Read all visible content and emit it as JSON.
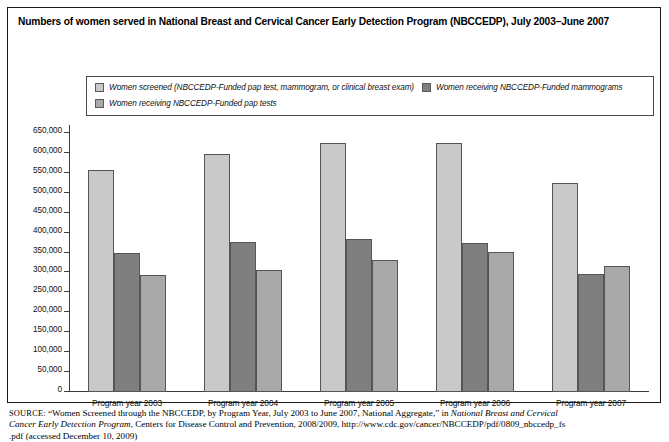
{
  "figure": {
    "title": "Numbers of women served in National Breast and Cervical Cancer Early Detection Program (NBCCEDP), July 2003–June 2007"
  },
  "legend": {
    "position": "top-inside-box",
    "entries": [
      {
        "label": "Women screened (NBCCEDP-Funded pap test, mammogram, or clinical breast exam)",
        "color": "#c9c9c9"
      },
      {
        "label": "Women receiving NBCCEDP-Funded mammograms",
        "color": "#7f7f7f"
      },
      {
        "label": "Women receiving NBCCEDP-Funded pap tests",
        "color": "#a9a9a9"
      }
    ]
  },
  "source": {
    "label": "SOURCE:",
    "line1_a": "“Women Screened through the NBCCEDP, by Program Year, July 2003 to June 2007, National Aggregate,” in ",
    "line1_italic": "National Breast and Cervical",
    "line2_italic": "Cancer Early Detection Program",
    "line2_b": ", Centers for Disease Control and Prevention, 2008/2009, http://www.cdc.gov/cancer/NBCCEDP/pdf/0809_nbccedp_fs",
    "line3": ".pdf (accessed December 10, 2009)"
  },
  "chart_data": {
    "type": "bar",
    "title": "Numbers of women served in National Breast and Cervical Cancer Early Detection Program (NBCCEDP), July 2003–June 2007",
    "xlabel": "",
    "ylabel": "",
    "grid": false,
    "legend_position": "top",
    "categories": [
      "Program year 2003",
      "Program year 2004",
      "Program year 2005",
      "Program year 2006",
      "Program year 2007"
    ],
    "ylim": [
      0,
      650000
    ],
    "ytick_step": 50000,
    "ytick_labels": [
      "0",
      "50,000",
      "100,000",
      "150,000",
      "200,000",
      "250,000",
      "300,000",
      "350,000",
      "400,000",
      "450,000",
      "500,000",
      "550,000",
      "600,000",
      "650,000"
    ],
    "ytick_values": [
      0,
      50000,
      100000,
      150000,
      200000,
      250000,
      300000,
      350000,
      400000,
      450000,
      500000,
      550000,
      600000,
      650000
    ],
    "series": [
      {
        "name": "Women screened (NBCCEDP-Funded pap test, mammogram, or clinical breast exam)",
        "color": "#c9c9c9",
        "values": [
          557000,
          598000,
          626000,
          626000,
          525000
        ]
      },
      {
        "name": "Women receiving NBCCEDP-Funded mammograms",
        "color": "#7f7f7f",
        "values": [
          350000,
          377000,
          385000,
          373000,
          296000
        ]
      },
      {
        "name": "Women receiving NBCCEDP-Funded pap tests",
        "color": "#a9a9a9",
        "values": [
          294000,
          307000,
          332000,
          352000,
          317000
        ]
      }
    ]
  }
}
